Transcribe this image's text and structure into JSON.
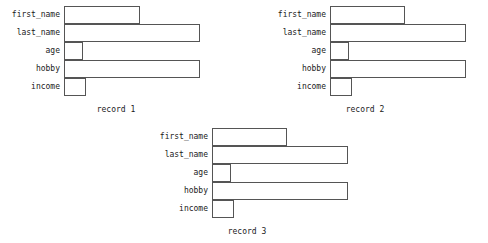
{
  "chart_data": {
    "type": "bar",
    "orientation": "horizontal",
    "title": "",
    "xlabel": "",
    "ylabel": "",
    "grid": false,
    "legend": null,
    "categories": [
      "first_name",
      "last_name",
      "age",
      "hobby",
      "income"
    ],
    "xlim": [
      0,
      140
    ],
    "panels": [
      {
        "caption": "record 1",
        "categories": [
          "first_name",
          "last_name",
          "age",
          "hobby",
          "income"
        ],
        "values": [
          76,
          136,
          19,
          136,
          22
        ]
      },
      {
        "caption": "record 2",
        "categories": [
          "first_name",
          "last_name",
          "age",
          "hobby",
          "income"
        ],
        "values": [
          75,
          136,
          19,
          136,
          22
        ]
      },
      {
        "caption": "record 3",
        "categories": [
          "first_name",
          "last_name",
          "age",
          "hobby",
          "income"
        ],
        "values": [
          75,
          136,
          19,
          136,
          22
        ]
      }
    ]
  },
  "style": {
    "bar_border_color": "#555555",
    "bar_fill_color": "#ffffff",
    "text_color": "#1a1a1a",
    "background_color": "#ffffff"
  }
}
